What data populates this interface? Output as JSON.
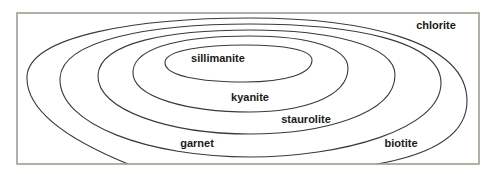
{
  "diagram": {
    "type": "metamorphic-zone-map",
    "zones": [
      {
        "id": "chlorite",
        "label": "chlorite",
        "x": 436,
        "y": 29
      },
      {
        "id": "biotite",
        "label": "biotite",
        "x": 401,
        "y": 147
      },
      {
        "id": "garnet",
        "label": "garnet",
        "x": 197,
        "y": 147
      },
      {
        "id": "staurolite",
        "label": "staurolite",
        "x": 306,
        "y": 123
      },
      {
        "id": "kyanite",
        "label": "kyanite",
        "x": 250,
        "y": 101
      },
      {
        "id": "sillimanite",
        "label": "sillimanite",
        "x": 218,
        "y": 62
      }
    ],
    "colors": {
      "line": "#3a3a3a",
      "frame": "#a69c90",
      "text": "#1a1a1a"
    }
  }
}
